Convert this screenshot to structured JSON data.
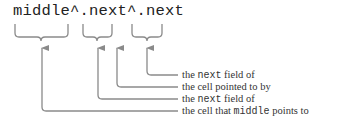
{
  "expression": "middle^.next^.next",
  "annotations": [
    {
      "id": "a1",
      "prefix": "the ",
      "code": "next",
      "suffix": " field of"
    },
    {
      "id": "a2",
      "prefix": "the cell pointed to by",
      "code": "",
      "suffix": ""
    },
    {
      "id": "a3",
      "prefix": "the ",
      "code": "next",
      "suffix": " field of"
    },
    {
      "id": "a4",
      "prefix": "the cell that ",
      "code": "middle",
      "suffix": " points to"
    }
  ],
  "colors": {
    "line": "#8a8a8a",
    "text": "#222222"
  }
}
